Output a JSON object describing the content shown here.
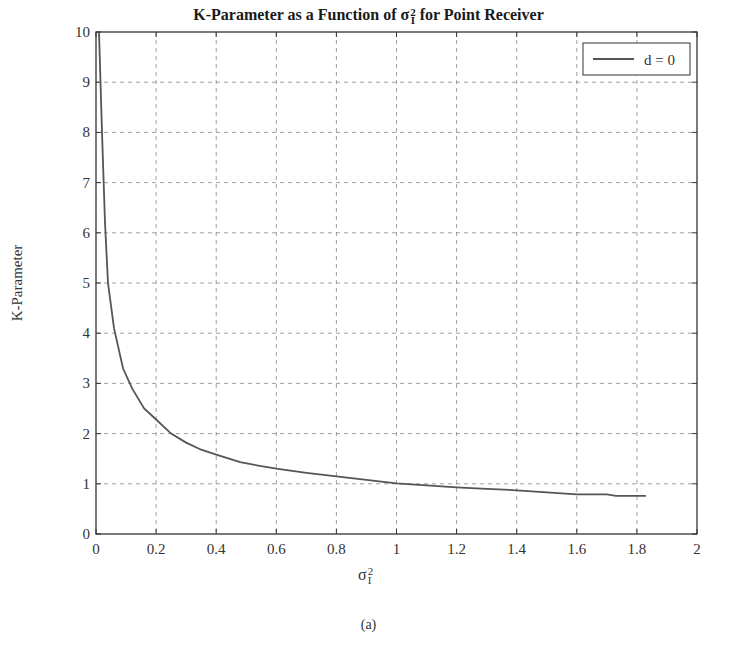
{
  "chart_data": {
    "type": "line",
    "title_parts": {
      "prefix": "K-Parameter as a Function of ",
      "symbol": "σ",
      "sub": "I",
      "sup": "2",
      "suffix": " for Point Receiver"
    },
    "xlabel": "σ_I²",
    "ylabel": "K-Parameter",
    "xlim": [
      0,
      2
    ],
    "ylim": [
      0,
      10
    ],
    "x_ticks": [
      "0",
      "0.2",
      "0.4",
      "0.6",
      "0.8",
      "1",
      "1.2",
      "1.4",
      "1.6",
      "1.8",
      "2"
    ],
    "y_ticks": [
      "0",
      "1",
      "2",
      "3",
      "4",
      "5",
      "6",
      "7",
      "8",
      "9",
      "10"
    ],
    "grid": true,
    "legend_position": "upper right",
    "series": [
      {
        "name": "d = 0",
        "color": "#555555",
        "x": [
          0.01,
          0.02,
          0.03,
          0.04,
          0.06,
          0.09,
          0.12,
          0.16,
          0.2,
          0.25,
          0.3,
          0.35,
          0.4,
          0.48,
          0.55,
          0.6,
          0.7,
          0.8,
          0.9,
          1.0,
          1.1,
          1.2,
          1.3,
          1.4,
          1.5,
          1.6,
          1.7,
          1.73,
          1.83
        ],
        "y": [
          10.0,
          8.0,
          6.2,
          5.0,
          4.1,
          3.3,
          2.9,
          2.5,
          2.28,
          2.0,
          1.82,
          1.68,
          1.58,
          1.43,
          1.35,
          1.3,
          1.22,
          1.15,
          1.08,
          1.01,
          0.97,
          0.93,
          0.9,
          0.87,
          0.83,
          0.79,
          0.79,
          0.76,
          0.76
        ]
      }
    ]
  },
  "caption": "(a)"
}
